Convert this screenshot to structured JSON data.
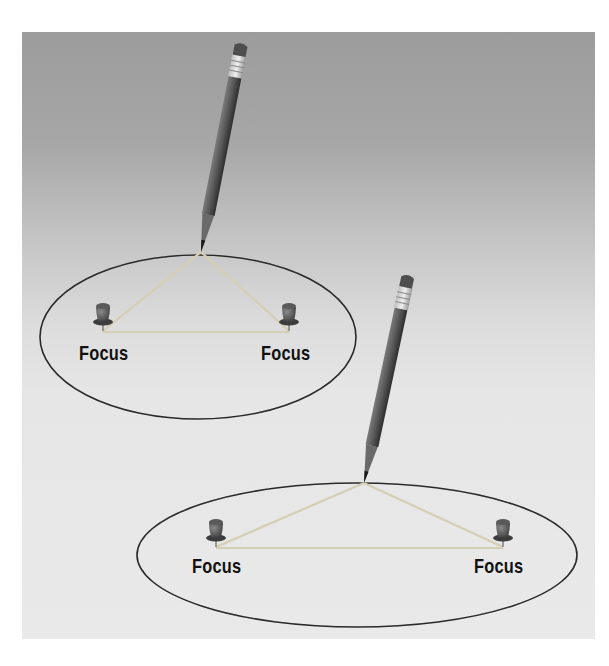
{
  "figure": {
    "colors": {
      "background_top": "#9c9c9c",
      "background_bottom": "#e9e9e9",
      "ellipse_stroke": "#2a2a2a",
      "string": "#d8d0b8",
      "pencil_body": "#555555",
      "pushpin": "#4a4a4a",
      "label": "#111111"
    },
    "diagrams": [
      {
        "name": "narrow-focus-ellipse",
        "labels": {
          "left_focus": "Focus",
          "right_focus": "Focus"
        }
      },
      {
        "name": "wide-focus-ellipse",
        "labels": {
          "left_focus": "Focus",
          "right_focus": "Focus"
        }
      }
    ]
  }
}
